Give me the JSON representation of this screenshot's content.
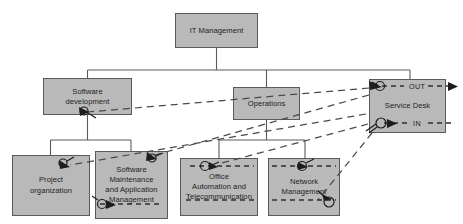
{
  "diagram": {
    "type": "org-chart",
    "colors": {
      "node_fill": "#b9b9b9",
      "node_border": "#5a5a5a",
      "tree_line": "#5a5a5a",
      "dashed_line": "#4a4a4a",
      "text": "#1d1d1d",
      "background": "#ffffff"
    },
    "nodes": {
      "it_management": {
        "label": "IT Management",
        "level": 0
      },
      "software_development": {
        "label": "Software\ndevelopment",
        "level": 1
      },
      "operations": {
        "label": "Operations",
        "level": 1
      },
      "service_desk": {
        "label": "Service Desk",
        "level": 1
      },
      "project_organization": {
        "label": "Project\norganization",
        "level": 2
      },
      "software_maintenance": {
        "label": "Software\nMaintenance\nand Application\nManagement",
        "level": 2
      },
      "office_automation": {
        "label": "Office\nAutomation and\nTelecommunication",
        "level": 2
      },
      "network_management": {
        "label": "Network\nManagement",
        "level": 2
      }
    },
    "service_desk_ports": {
      "out_label": "OUT",
      "in_label": "IN"
    },
    "hierarchy_edges": [
      {
        "from": "it_management",
        "to": "software_development"
      },
      {
        "from": "it_management",
        "to": "operations"
      },
      {
        "from": "it_management",
        "to": "service_desk"
      },
      {
        "from": "software_development",
        "to": "project_organization"
      },
      {
        "from": "software_development",
        "to": "software_maintenance"
      },
      {
        "from": "operations",
        "to": "office_automation"
      },
      {
        "from": "operations",
        "to": "network_management"
      }
    ],
    "interface_edges": [
      {
        "from": "service_desk",
        "to": "software_development",
        "style": "dashed"
      },
      {
        "from": "service_desk",
        "to": "software_maintenance",
        "style": "dashed"
      },
      {
        "from": "service_desk",
        "to": "project_organization",
        "style": "dashed"
      },
      {
        "from": "service_desk",
        "to": "office_automation",
        "style": "dashed"
      },
      {
        "from": "service_desk",
        "to": "network_management",
        "style": "dashed"
      }
    ],
    "icons": {
      "interface_marker": "circle-arrow-interface-icon",
      "out_arrow": "arrow-right-icon",
      "in_arrow": "arrow-left-icon"
    }
  }
}
